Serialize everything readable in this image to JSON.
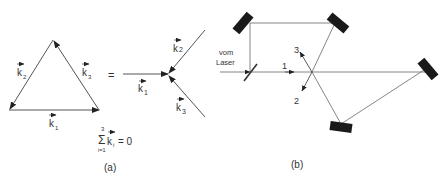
{
  "panel_a": {
    "caption": "(a)",
    "triangle": {
      "edges": [
        {
          "label": "k",
          "sub": "1"
        },
        {
          "label": "k",
          "sub": "2"
        },
        {
          "label": "k",
          "sub": "3"
        }
      ]
    },
    "equals": "=",
    "vertex": {
      "vectors": [
        {
          "label": "k",
          "sub": "1"
        },
        {
          "label": "k",
          "sub": "2"
        },
        {
          "label": "k",
          "sub": "3"
        }
      ]
    },
    "sum_formula": {
      "sigma": "Σ",
      "upper": "3",
      "lower": "i=1",
      "term": "k",
      "term_sub": "i",
      "rhs": "= 0"
    }
  },
  "panel_b": {
    "caption": "(b)",
    "input_label_line1": "vom",
    "input_label_line2": "Laser",
    "beam_labels": [
      "1",
      "2",
      "3"
    ],
    "mirror_count": 4,
    "beamsplitter_count": 1
  },
  "colors": {
    "line": "#555555",
    "mirror": "#1a1a1a",
    "text": "#333333"
  }
}
